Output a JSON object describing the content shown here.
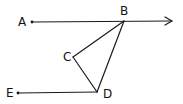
{
  "diagram": {
    "type": "geometry",
    "colors": {
      "stroke": "#1a1a1a",
      "background": "#ffffff"
    },
    "points": [
      {
        "id": "A",
        "label": "A",
        "x": 32,
        "y": 22,
        "label_x": 18,
        "label_y": 26
      },
      {
        "id": "B",
        "label": "B",
        "x": 124,
        "y": 21,
        "label_x": 120,
        "label_y": 15
      },
      {
        "id": "C",
        "label": "C",
        "x": 73,
        "y": 57,
        "label_x": 63,
        "label_y": 61
      },
      {
        "id": "D",
        "label": "D",
        "x": 97,
        "y": 92,
        "label_x": 103,
        "label_y": 98
      },
      {
        "id": "E",
        "label": "E",
        "x": 18,
        "y": 93,
        "label_x": 6,
        "label_y": 97
      }
    ],
    "segments": [
      {
        "from": "B",
        "to": "C"
      },
      {
        "from": "C",
        "to": "D"
      },
      {
        "from": "B",
        "to": "D"
      },
      {
        "from": "E",
        "to": "D"
      }
    ],
    "rays": [
      {
        "from": "A",
        "through": "B",
        "arrow_tip_x": 172,
        "arrow_tip_y": 21
      }
    ]
  }
}
